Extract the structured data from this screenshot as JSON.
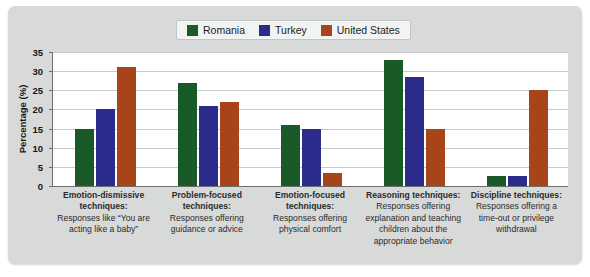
{
  "chart_data": {
    "type": "bar",
    "title": "",
    "xlabel": "",
    "ylabel": "Percentage (%)",
    "ylim": [
      0,
      35
    ],
    "yticks": [
      0,
      5,
      10,
      15,
      20,
      25,
      30,
      35
    ],
    "grid": true,
    "legend_position": "top-center",
    "categories": [
      "Emotion-dismissive techniques: Responses like “You are acting like a baby”",
      "Problem-focused techniques: Responses offering guidance or advice",
      "Emotion-focused techniques: Responses offering physical comfort",
      "Reasoning techniques: Responses offering explanation and teaching children about the appropriate behavior",
      "Discipline techniques: Responses offering a time-out or privilege withdrawal"
    ],
    "series": [
      {
        "name": "Romania",
        "color": "#1a5a28",
        "values": [
          15,
          27,
          16,
          33,
          2.5
        ]
      },
      {
        "name": "Turkey",
        "color": "#2b2b8c",
        "values": [
          20,
          21,
          15,
          28.5,
          2.5
        ]
      },
      {
        "name": "United States",
        "color": "#a8441a",
        "values": [
          31,
          22,
          3.5,
          15,
          25
        ]
      }
    ]
  },
  "legend": {
    "items": [
      {
        "label": "Romania",
        "color": "#1a5a28"
      },
      {
        "label": "Turkey",
        "color": "#2b2b8c"
      },
      {
        "label": "United States",
        "color": "#a8441a"
      }
    ]
  },
  "axis": {
    "y_label": "Percentage (%)",
    "y_ticks": [
      "35",
      "30",
      "25",
      "20",
      "15",
      "10",
      "5",
      "0"
    ]
  },
  "categories_display": [
    {
      "title": "Emotion-dismissive techniques:",
      "desc": "Responses like “You are acting like a baby”"
    },
    {
      "title": "Problem-focused techniques:",
      "desc": "Responses offering guidance or advice"
    },
    {
      "title": "Emotion-focused techniques:",
      "desc": "Responses offering physical comfort"
    },
    {
      "title": "Reasoning techniques:",
      "desc": "Responses offering explanation and teaching children about the appropriate behavior"
    },
    {
      "title": "Discipline techniques:",
      "desc": "Responses offering a time-out or privilege withdrawal"
    }
  ],
  "colors": {
    "panel_background": "#d8dada",
    "plot_background": "#ffffff",
    "gridline": "#c9cbcb",
    "axis": "#6c6e6e"
  }
}
